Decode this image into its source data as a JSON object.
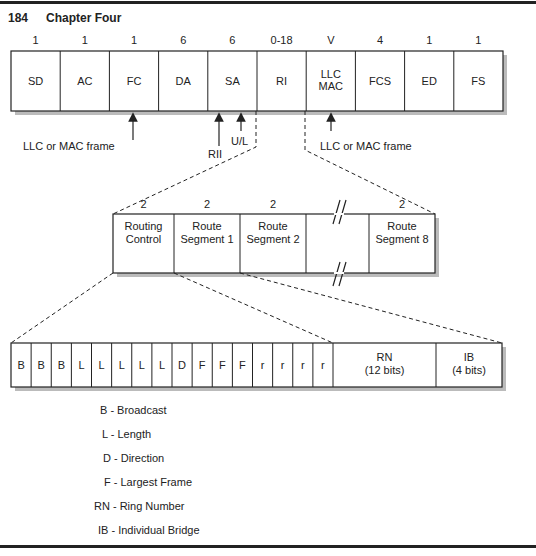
{
  "header": {
    "page_number": "184",
    "chapter": "Chapter Four"
  },
  "frame": {
    "fields": [
      {
        "size": "1",
        "label": [
          "SD"
        ]
      },
      {
        "size": "1",
        "label": [
          "AC"
        ]
      },
      {
        "size": "1",
        "label": [
          "FC"
        ]
      },
      {
        "size": "6",
        "label": [
          "DA"
        ]
      },
      {
        "size": "6",
        "label": [
          "SA"
        ]
      },
      {
        "size": "0-18",
        "label": [
          "RI"
        ]
      },
      {
        "size": "V",
        "label": [
          "LLC",
          "MAC"
        ]
      },
      {
        "size": "4",
        "label": [
          "FCS"
        ]
      },
      {
        "size": "1",
        "label": [
          "ED"
        ]
      },
      {
        "size": "1",
        "label": [
          "FS"
        ]
      }
    ],
    "annotations": {
      "left_llc_mac": "LLC or MAC frame",
      "rii": "RII",
      "ul": "U/L",
      "right_llc_mac": "LLC or MAC frame"
    }
  },
  "routing_info": {
    "fields": [
      {
        "size": "2",
        "label": [
          "Routing",
          "Control"
        ]
      },
      {
        "size": "2",
        "label": [
          "Route",
          "Segment 1"
        ]
      },
      {
        "size": "2",
        "label": [
          "Route",
          "Segment 2"
        ]
      },
      {
        "size": "",
        "label": []
      },
      {
        "size": "2",
        "label": [
          "Route",
          "Segment 8"
        ]
      }
    ]
  },
  "bits": {
    "cells": [
      "B",
      "B",
      "B",
      "L",
      "L",
      "L",
      "L",
      "L",
      "D",
      "F",
      "F",
      "F",
      "r",
      "r",
      "r",
      "r"
    ],
    "rn": [
      "RN",
      "(12 bits)"
    ],
    "ib": [
      "IB",
      "(4 bits)"
    ]
  },
  "legend": [
    "B - Broadcast",
    "L - Length",
    "D - Direction",
    "F - Largest Frame",
    "RN - Ring Number",
    "IB - Individual Bridge"
  ]
}
